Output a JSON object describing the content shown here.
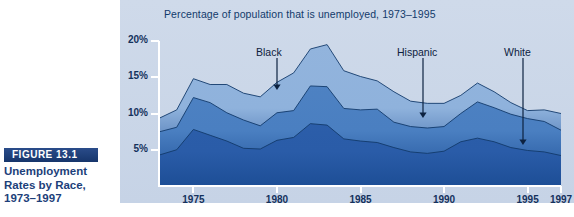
{
  "figure": {
    "badge_label": "FIGURE 13.1",
    "caption_line1": "Unemployment",
    "caption_line2": "Rates by Race,",
    "caption_line3": "1973–1997"
  },
  "colors": {
    "panel_bg": "#ccd8e8",
    "band_dark": "#2a5ca8",
    "band_mid": "#4a7fc1",
    "band_light": "#8fb2dc",
    "axis": "#ffffff",
    "text_dark": "#14315c",
    "badge_bg": "#1d3f7a"
  },
  "annotations": [
    {
      "label": "Black",
      "label_x": 136,
      "label_y": 46,
      "arrow_x": 157,
      "arrow_top": 58,
      "arrow_bottom": 90
    },
    {
      "label": "Hispanic",
      "label_x": 277,
      "label_y": 46,
      "arrow_x": 303,
      "arrow_top": 58,
      "arrow_bottom": 118
    },
    {
      "label": "White",
      "label_x": 384,
      "label_y": 46,
      "arrow_x": 403,
      "arrow_top": 58,
      "arrow_bottom": 145
    }
  ],
  "chart_data": {
    "type": "area",
    "title": "Percentage of population that is unemployed, 1973–1995",
    "xlabel": "",
    "ylabel": "",
    "ylim": [
      0,
      20
    ],
    "xlim": [
      1973,
      1997
    ],
    "grid": false,
    "legend": "annotated-arrows",
    "ytick_labels": [
      "20%",
      "15%",
      "10%",
      "5%"
    ],
    "ytick_values": [
      20,
      15,
      10,
      5
    ],
    "xtick_labels": [
      "1975",
      "1980",
      "1985",
      "1990",
      "1995",
      "1997"
    ],
    "xtick_values": [
      1975,
      1980,
      1985,
      1990,
      1995,
      1997
    ],
    "x": [
      1973,
      1974,
      1975,
      1976,
      1977,
      1978,
      1979,
      1980,
      1981,
      1982,
      1983,
      1984,
      1985,
      1986,
      1987,
      1988,
      1989,
      1990,
      1991,
      1992,
      1993,
      1994,
      1995,
      1996,
      1997
    ],
    "series": [
      {
        "name": "Black",
        "color": "#8fb2dc",
        "values": [
          9.4,
          10.5,
          14.8,
          14.0,
          14.0,
          12.8,
          12.3,
          14.3,
          15.6,
          18.9,
          19.5,
          15.9,
          15.1,
          14.5,
          13.0,
          11.7,
          11.4,
          11.4,
          12.5,
          14.2,
          13.0,
          11.5,
          10.4,
          10.5,
          10.0
        ]
      },
      {
        "name": "Hispanic",
        "color": "#4a7fc1",
        "values": [
          7.5,
          8.1,
          12.2,
          11.5,
          10.1,
          9.1,
          8.3,
          10.1,
          10.4,
          13.8,
          13.7,
          10.7,
          10.5,
          10.6,
          8.8,
          8.2,
          8.0,
          8.2,
          10.0,
          11.6,
          10.8,
          9.9,
          9.3,
          8.9,
          7.7
        ]
      },
      {
        "name": "White",
        "color": "#2a5ca8",
        "values": [
          4.3,
          5.0,
          7.8,
          7.0,
          6.2,
          5.2,
          5.1,
          6.3,
          6.7,
          8.6,
          8.4,
          6.5,
          6.2,
          6.0,
          5.3,
          4.7,
          4.5,
          4.8,
          6.1,
          6.6,
          6.1,
          5.3,
          4.9,
          4.7,
          4.2
        ]
      }
    ]
  }
}
